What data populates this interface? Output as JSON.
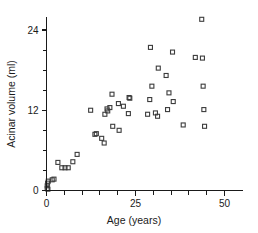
{
  "chart_data": {
    "type": "scatter",
    "title": "",
    "xlabel": "Age (years)",
    "ylabel": "Acinar volume (ml)",
    "xlim": [
      0,
      52
    ],
    "ylim": [
      0,
      27
    ],
    "xticks_labeled": [
      0,
      25,
      50
    ],
    "yticks_labeled": [
      0,
      12,
      24
    ],
    "xtick_minor_step": 5,
    "ytick_minor_step": 3,
    "grid": false,
    "legend": null,
    "marker": "open-square",
    "points": [
      {
        "x": 0.2,
        "y": 0.3
      },
      {
        "x": 0.2,
        "y": 0.7
      },
      {
        "x": 0.3,
        "y": 1.1
      },
      {
        "x": 0.4,
        "y": 0.2
      },
      {
        "x": 0.5,
        "y": 1.4
      },
      {
        "x": 1.6,
        "y": 1.6
      },
      {
        "x": 2.1,
        "y": 1.7
      },
      {
        "x": 3.2,
        "y": 4.2
      },
      {
        "x": 4.3,
        "y": 3.4
      },
      {
        "x": 5.2,
        "y": 3.4
      },
      {
        "x": 6.1,
        "y": 3.4
      },
      {
        "x": 7.4,
        "y": 4.3
      },
      {
        "x": 8.6,
        "y": 5.4
      },
      {
        "x": 12.4,
        "y": 12.0
      },
      {
        "x": 13.6,
        "y": 8.4
      },
      {
        "x": 14.0,
        "y": 8.5
      },
      {
        "x": 15.5,
        "y": 7.8
      },
      {
        "x": 16.2,
        "y": 7.1
      },
      {
        "x": 16.4,
        "y": 11.4
      },
      {
        "x": 17.0,
        "y": 12.2
      },
      {
        "x": 17.2,
        "y": 11.9
      },
      {
        "x": 17.8,
        "y": 12.4
      },
      {
        "x": 18.4,
        "y": 14.4
      },
      {
        "x": 18.6,
        "y": 9.6
      },
      {
        "x": 20.2,
        "y": 13.0
      },
      {
        "x": 20.4,
        "y": 9.0
      },
      {
        "x": 21.6,
        "y": 12.6
      },
      {
        "x": 23.2,
        "y": 13.9
      },
      {
        "x": 23.4,
        "y": 13.8
      },
      {
        "x": 23.0,
        "y": 11.5
      },
      {
        "x": 28.4,
        "y": 11.4
      },
      {
        "x": 29.0,
        "y": 13.6
      },
      {
        "x": 29.2,
        "y": 21.4
      },
      {
        "x": 29.6,
        "y": 15.6
      },
      {
        "x": 30.6,
        "y": 11.6
      },
      {
        "x": 31.2,
        "y": 11.1
      },
      {
        "x": 31.4,
        "y": 18.3
      },
      {
        "x": 33.6,
        "y": 17.2
      },
      {
        "x": 34.0,
        "y": 12.1
      },
      {
        "x": 34.4,
        "y": 14.6
      },
      {
        "x": 35.4,
        "y": 20.7
      },
      {
        "x": 35.6,
        "y": 13.3
      },
      {
        "x": 38.4,
        "y": 9.8
      },
      {
        "x": 41.8,
        "y": 19.9
      },
      {
        "x": 43.6,
        "y": 25.6
      },
      {
        "x": 43.8,
        "y": 19.8
      },
      {
        "x": 44.0,
        "y": 15.6
      },
      {
        "x": 44.2,
        "y": 12.1
      },
      {
        "x": 44.4,
        "y": 9.6
      }
    ]
  }
}
